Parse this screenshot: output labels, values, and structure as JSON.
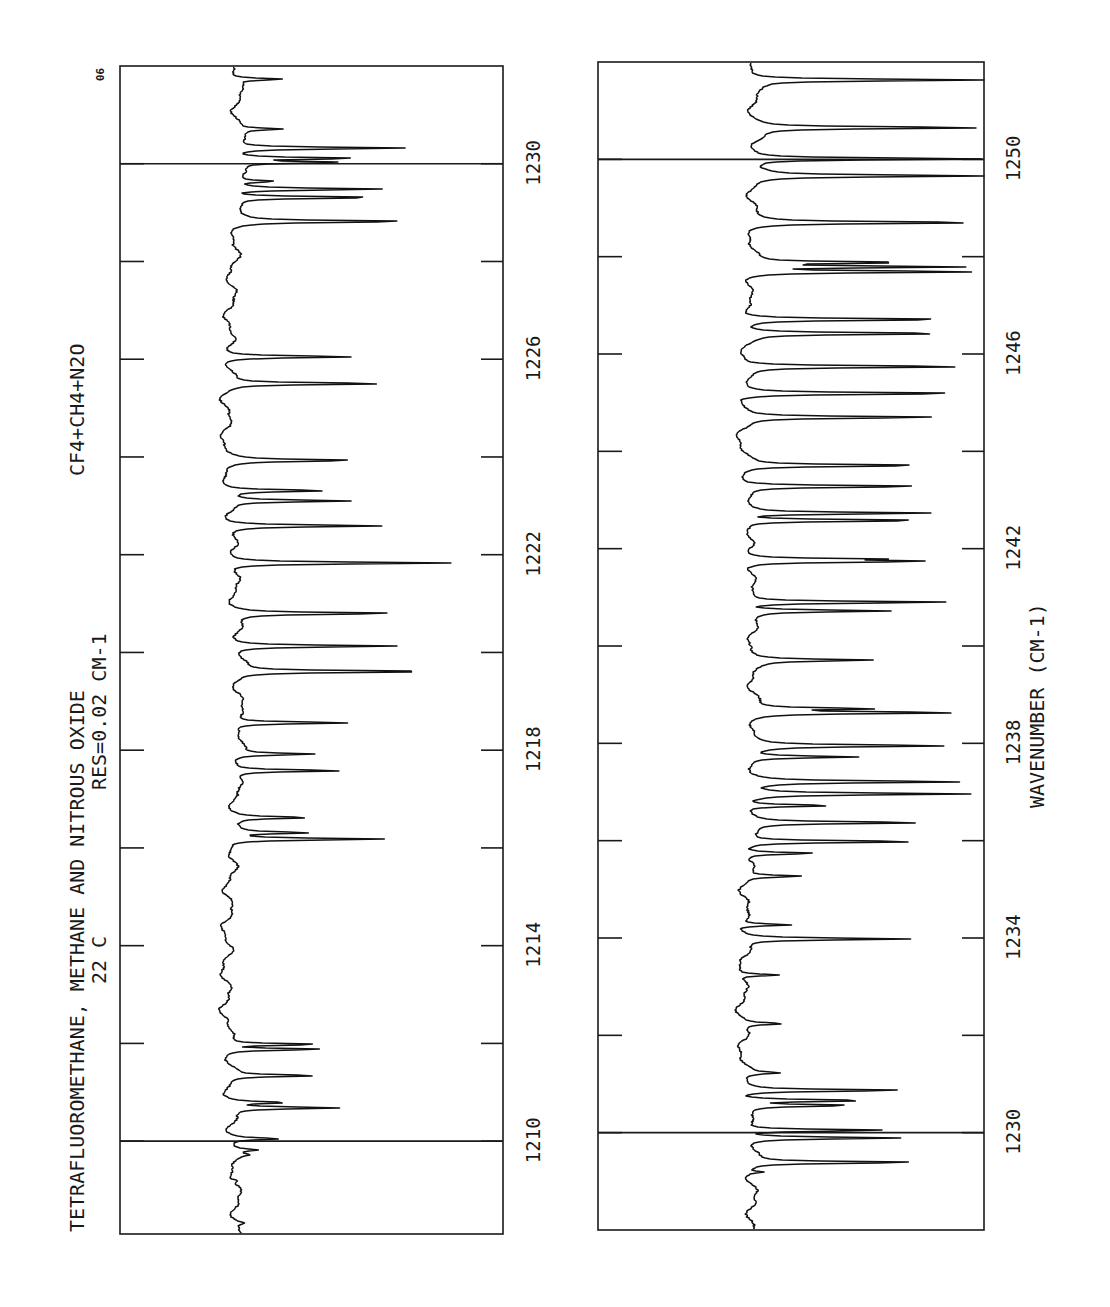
{
  "page": {
    "corner_label": "90",
    "orientation": "rotated-90-ccw"
  },
  "header": {
    "title": "TETRAFLUOROMETHANE, METHANE AND NITROUS OXIDE",
    "resolution": "RES=0.02 CM-1",
    "temperature": "22 C",
    "sample": "CF4+CH4+N2O"
  },
  "axis": {
    "xlabel": "WAVENUMBER (CM-1)"
  },
  "colors": {
    "ink": "#111111",
    "background": "#ffffff"
  },
  "chart_data": [
    {
      "type": "line",
      "panel": "upper",
      "title": "TETRAFLUOROMETHANE, METHANE AND NITROUS OXIDE",
      "subtitle": "RES=0.02 CM-1  22 C  CF4+CH4+N2O",
      "xlabel": "",
      "ylabel": "Absorption (relative)",
      "xlim": [
        1208.1,
        1232.0
      ],
      "tick_labels": [
        "1210",
        "1214",
        "1218",
        "1222",
        "1226",
        "1230"
      ],
      "major_ticks": [
        1210,
        1212,
        1214,
        1216,
        1218,
        1220,
        1222,
        1224,
        1226,
        1228,
        1230
      ],
      "marker_lines": [
        1210,
        1230
      ],
      "grid": false,
      "baseline_x": 232,
      "peaks": [
        [
          1231.73,
          283
        ],
        [
          1230.71,
          274
        ],
        [
          1230.32,
          404
        ],
        [
          1230.11,
          362
        ],
        [
          1230.03,
          342
        ],
        [
          1229.64,
          270
        ],
        [
          1229.48,
          381
        ],
        [
          1229.31,
          388
        ],
        [
          1228.82,
          409
        ],
        [
          1226.05,
          363
        ],
        [
          1225.5,
          395
        ],
        [
          1223.93,
          361
        ],
        [
          1223.31,
          332
        ],
        [
          1223.1,
          353
        ],
        [
          1222.59,
          388
        ],
        [
          1221.83,
          454
        ],
        [
          1220.8,
          396
        ],
        [
          1220.13,
          395
        ],
        [
          1219.61,
          443
        ],
        [
          1218.56,
          351
        ],
        [
          1217.92,
          311
        ],
        [
          1217.58,
          346
        ],
        [
          1216.62,
          308
        ],
        [
          1216.31,
          305
        ],
        [
          1216.18,
          389
        ],
        [
          1211.98,
          333
        ],
        [
          1211.88,
          333
        ],
        [
          1211.34,
          320
        ],
        [
          1210.79,
          290
        ],
        [
          1210.68,
          339
        ],
        [
          1210.05,
          283
        ],
        [
          1209.82,
          254
        ],
        [
          1209.72,
          242
        ],
        [
          1209.19,
          240
        ],
        [
          1208.33,
          240
        ]
      ]
    },
    {
      "type": "line",
      "panel": "lower",
      "title": "",
      "xlabel": "WAVENUMBER (CM-1)",
      "ylabel": "Absorption (relative)",
      "xlim": [
        1228.0,
        1252.0
      ],
      "tick_labels": [
        "1230",
        "1234",
        "1238",
        "1242",
        "1246",
        "1250"
      ],
      "major_ticks": [
        1230,
        1232,
        1234,
        1236,
        1238,
        1240,
        1242,
        1244,
        1246,
        1248,
        1250
      ],
      "marker_lines": [
        1230,
        1250
      ],
      "grid": false,
      "baseline_x": 748,
      "peaks": [
        [
          1251.63,
          984
        ],
        [
          1250.65,
          984
        ],
        [
          1250.01,
          984
        ],
        [
          1249.66,
          984
        ],
        [
          1248.7,
          984
        ],
        [
          1247.88,
          916
        ],
        [
          1247.79,
          968
        ],
        [
          1247.69,
          984
        ],
        [
          1246.71,
          968
        ],
        [
          1246.42,
          958
        ],
        [
          1245.74,
          984
        ],
        [
          1245.19,
          983
        ],
        [
          1244.7,
          945
        ],
        [
          1243.71,
          939
        ],
        [
          1243.28,
          941
        ],
        [
          1242.73,
          939
        ],
        [
          1242.58,
          946
        ],
        [
          1241.78,
          908
        ],
        [
          1241.74,
          943
        ],
        [
          1240.9,
          957
        ],
        [
          1240.72,
          888
        ],
        [
          1239.71,
          863
        ],
        [
          1238.71,
          870
        ],
        [
          1238.63,
          958
        ],
        [
          1237.95,
          940
        ],
        [
          1237.72,
          856
        ],
        [
          1237.21,
          958
        ],
        [
          1236.96,
          966
        ],
        [
          1236.72,
          840
        ],
        [
          1236.37,
          927
        ],
        [
          1235.98,
          931
        ],
        [
          1235.74,
          821
        ],
        [
          1235.27,
          806
        ],
        [
          1234.27,
          802
        ],
        [
          1233.98,
          917
        ],
        [
          1233.24,
          791
        ],
        [
          1232.24,
          790
        ],
        [
          1231.23,
          780
        ],
        [
          1230.87,
          918
        ],
        [
          1230.66,
          876
        ],
        [
          1230.56,
          855
        ],
        [
          1230.05,
          895
        ],
        [
          1229.89,
          902
        ],
        [
          1229.39,
          923
        ],
        [
          1229.19,
          765
        ]
      ]
    }
  ]
}
